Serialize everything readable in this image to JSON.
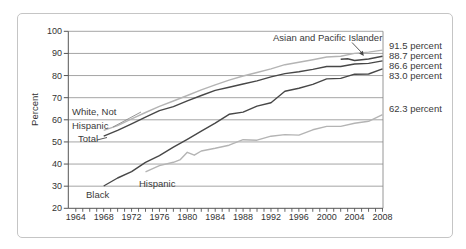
{
  "figure": {
    "ylabel": "Percent",
    "annotations": {
      "white_line1": "White, Not",
      "white_line2": "Hispanic",
      "total": "Total",
      "black": "Black",
      "hispanic": "Hispanic",
      "asian": "Asian and Pacific Islander"
    }
  },
  "chart_data": {
    "type": "line",
    "title": "",
    "xlabel": "",
    "ylabel": "Percent",
    "xlim": [
      1964,
      2008
    ],
    "ylim": [
      20,
      100
    ],
    "grid": "horizontal",
    "x_tick_labels": [
      "1964",
      "1968",
      "1972",
      "1976",
      "1980",
      "1984",
      "1988",
      "1992",
      "1996",
      "2000",
      "2004",
      "2008"
    ],
    "x_minor_tick_step_years": 1,
    "y_tick_labels": [
      "100",
      "90",
      "80",
      "70",
      "60",
      "50",
      "40",
      "30",
      "20"
    ],
    "y_ticks": [
      20,
      30,
      40,
      50,
      60,
      70,
      80,
      90,
      100
    ],
    "colors": {
      "dark_line": "#474747",
      "light_line": "#b4b4b4",
      "grid_line": "#9b9b9b",
      "axis_line": "#555555"
    },
    "series": [
      {
        "name": "White, Not Hispanic",
        "shade": "light",
        "end_label": "91.5 percent",
        "points": [
          [
            1968,
            55.2
          ],
          [
            1970,
            57.4
          ],
          [
            1972,
            60.4
          ],
          [
            1974,
            63.3
          ],
          [
            1976,
            66.1
          ],
          [
            1978,
            68.5
          ],
          [
            1980,
            71.0
          ],
          [
            1982,
            73.5
          ],
          [
            1984,
            75.8
          ],
          [
            1986,
            77.9
          ],
          [
            1988,
            79.8
          ],
          [
            1990,
            81.4
          ],
          [
            1992,
            83.0
          ],
          [
            1994,
            84.9
          ],
          [
            1996,
            86.0
          ],
          [
            1998,
            87.1
          ],
          [
            2000,
            88.4
          ],
          [
            2002,
            88.7
          ],
          [
            2004,
            90.0
          ],
          [
            2006,
            90.6
          ],
          [
            2008,
            91.5
          ]
        ]
      },
      {
        "name": "Asian and Pacific Islander",
        "shade": "dark",
        "end_label": "88.7 percent",
        "points": [
          [
            2002,
            87.4
          ],
          [
            2003,
            87.6
          ],
          [
            2004,
            86.8
          ],
          [
            2006,
            87.5
          ],
          [
            2008,
            88.7
          ]
        ]
      },
      {
        "name": "Total",
        "shade": "dark",
        "end_label": "86.6 percent",
        "points": [
          [
            1968,
            52.6
          ],
          [
            1970,
            55.2
          ],
          [
            1972,
            58.2
          ],
          [
            1974,
            61.2
          ],
          [
            1976,
            64.1
          ],
          [
            1978,
            65.9
          ],
          [
            1980,
            68.6
          ],
          [
            1982,
            71.0
          ],
          [
            1984,
            73.3
          ],
          [
            1986,
            74.7
          ],
          [
            1988,
            76.2
          ],
          [
            1990,
            77.6
          ],
          [
            1992,
            79.4
          ],
          [
            1994,
            80.9
          ],
          [
            1996,
            81.7
          ],
          [
            1998,
            82.8
          ],
          [
            2000,
            84.1
          ],
          [
            2002,
            84.1
          ],
          [
            2004,
            85.2
          ],
          [
            2006,
            85.5
          ],
          [
            2008,
            86.6
          ]
        ]
      },
      {
        "name": "Black",
        "shade": "dark",
        "end_label": "83.0 percent",
        "points": [
          [
            1968,
            30.1
          ],
          [
            1970,
            33.7
          ],
          [
            1972,
            36.6
          ],
          [
            1974,
            40.8
          ],
          [
            1976,
            43.8
          ],
          [
            1978,
            47.6
          ],
          [
            1980,
            51.2
          ],
          [
            1982,
            54.9
          ],
          [
            1984,
            58.5
          ],
          [
            1986,
            62.5
          ],
          [
            1988,
            63.5
          ],
          [
            1990,
            66.2
          ],
          [
            1992,
            67.7
          ],
          [
            1994,
            72.9
          ],
          [
            1996,
            74.3
          ],
          [
            1998,
            76.0
          ],
          [
            2000,
            78.5
          ],
          [
            2002,
            78.7
          ],
          [
            2004,
            80.6
          ],
          [
            2006,
            80.7
          ],
          [
            2008,
            83.0
          ]
        ]
      },
      {
        "name": "Hispanic",
        "shade": "light",
        "end_label": "62.3 percent",
        "points": [
          [
            1974,
            36.5
          ],
          [
            1976,
            39.3
          ],
          [
            1978,
            40.8
          ],
          [
            1979,
            42.0
          ],
          [
            1980,
            45.3
          ],
          [
            1981,
            44.0
          ],
          [
            1982,
            45.9
          ],
          [
            1984,
            47.1
          ],
          [
            1986,
            48.5
          ],
          [
            1988,
            51.0
          ],
          [
            1990,
            50.8
          ],
          [
            1992,
            52.6
          ],
          [
            1994,
            53.3
          ],
          [
            1996,
            53.1
          ],
          [
            1998,
            55.5
          ],
          [
            2000,
            57.0
          ],
          [
            2002,
            57.0
          ],
          [
            2004,
            58.4
          ],
          [
            2006,
            59.3
          ],
          [
            2008,
            62.3
          ]
        ]
      }
    ]
  }
}
